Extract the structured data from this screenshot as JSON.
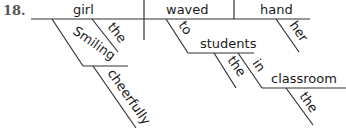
{
  "problem_number": "18.",
  "diagram": {
    "type": "sentence-diagram",
    "subject": "girl",
    "verb": "waved",
    "direct_object": "hand",
    "subject_modifiers": {
      "article": "the",
      "participle": "Smiling",
      "participle_modifier": "cheerfully"
    },
    "object_modifier": "her",
    "prepositional_phrase": {
      "preposition": "to",
      "object": "students",
      "object_article": "the"
    },
    "nested_phrase": {
      "preposition": "in",
      "object": "classroom",
      "object_article": "the"
    }
  },
  "colors": {
    "line": "#333333",
    "text": "#1a1a1a",
    "number": "#555555"
  }
}
